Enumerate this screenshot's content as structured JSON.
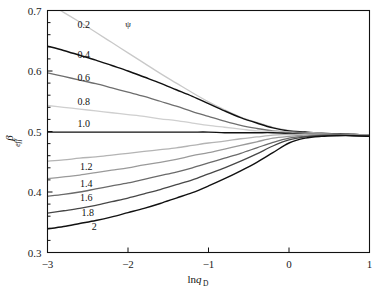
{
  "chart_data": {
    "type": "line",
    "title": "",
    "xlabel": "lnq_D",
    "xlabel_main": "ln",
    "xlabel_var": "q",
    "xlabel_sub": "D",
    "ylabel": "β_eff",
    "ylabel_main": "β",
    "ylabel_sub": "eff",
    "legend_symbol": "ψ",
    "legend_position": "inline-curve-labels",
    "grid": false,
    "xlim": [
      -3,
      1
    ],
    "ylim": [
      0.3,
      0.7
    ],
    "xticks": [
      -3,
      -2,
      -1,
      0,
      1
    ],
    "xtick_labels": [
      "−3",
      "−2",
      "−1",
      "0",
      "1"
    ],
    "yticks": [
      0.3,
      0.4,
      0.5,
      0.6,
      0.7
    ],
    "ytick_labels": [
      "0.3",
      "0.4",
      "0.5",
      "0.6",
      "0.7"
    ],
    "yminor_ticks": [
      0.32,
      0.34,
      0.36,
      0.38,
      0.42,
      0.44,
      0.46,
      0.48,
      0.52,
      0.54,
      0.56,
      0.58,
      0.62,
      0.64,
      0.66,
      0.68
    ],
    "x": [
      -3.0,
      -2.8,
      -2.6,
      -2.4,
      -2.2,
      -2.0,
      -1.8,
      -1.6,
      -1.4,
      -1.2,
      -1.0,
      -0.8,
      -0.6,
      -0.4,
      -0.2,
      0.0,
      0.2,
      0.4,
      0.6,
      0.8,
      1.0
    ],
    "series": [
      {
        "name": "0.2",
        "label": "0.2",
        "color": "#c9c9c9",
        "width": 1.3,
        "label_x": -2.55,
        "label_y": 0.676,
        "values": [
          0.712,
          0.697,
          0.681,
          0.664,
          0.647,
          0.63,
          0.613,
          0.596,
          0.58,
          0.564,
          0.549,
          0.536,
          0.524,
          0.515,
          0.507,
          0.502,
          0.499,
          0.497,
          0.496,
          0.495,
          0.494
        ]
      },
      {
        "name": "0.4",
        "label": "0.4",
        "color": "#111111",
        "width": 1.5,
        "label_x": -2.55,
        "label_y": 0.626,
        "values": [
          0.641,
          0.634,
          0.626,
          0.618,
          0.609,
          0.6,
          0.59,
          0.58,
          0.569,
          0.558,
          0.546,
          0.534,
          0.523,
          0.514,
          0.506,
          0.501,
          0.499,
          0.497,
          0.496,
          0.495,
          0.494
        ]
      },
      {
        "name": "0.6",
        "label": "0.6",
        "color": "#6e6e6e",
        "width": 1.3,
        "label_x": -2.55,
        "label_y": 0.589,
        "values": [
          0.597,
          0.591,
          0.585,
          0.579,
          0.572,
          0.565,
          0.558,
          0.55,
          0.542,
          0.533,
          0.525,
          0.517,
          0.51,
          0.505,
          0.501,
          0.499,
          0.498,
          0.497,
          0.496,
          0.495,
          0.494
        ]
      },
      {
        "name": "0.8",
        "label": "0.8",
        "color": "#cfcfcf",
        "width": 1.3,
        "label_x": -2.55,
        "label_y": 0.548,
        "values": [
          0.543,
          0.54,
          0.537,
          0.534,
          0.531,
          0.528,
          0.525,
          0.521,
          0.518,
          0.514,
          0.51,
          0.507,
          0.504,
          0.501,
          0.5,
          0.499,
          0.498,
          0.497,
          0.496,
          0.495,
          0.494
        ]
      },
      {
        "name": "1.0",
        "label": "1.0",
        "color": "#111111",
        "width": 1.4,
        "label_x": -2.55,
        "label_y": 0.512,
        "values": [
          0.499,
          0.499,
          0.499,
          0.499,
          0.499,
          0.499,
          0.499,
          0.499,
          0.499,
          0.499,
          0.499,
          0.498,
          0.498,
          0.498,
          0.498,
          0.497,
          0.497,
          0.496,
          0.496,
          0.495,
          0.494
        ]
      },
      {
        "name": "1.2",
        "label": "1.2",
        "color": "#b4b4b4",
        "width": 1.3,
        "label_x": -2.52,
        "label_y": 0.441,
        "values": [
          0.451,
          0.453,
          0.456,
          0.458,
          0.461,
          0.464,
          0.467,
          0.47,
          0.473,
          0.477,
          0.481,
          0.484,
          0.488,
          0.491,
          0.494,
          0.495,
          0.496,
          0.496,
          0.495,
          0.495,
          0.494
        ]
      },
      {
        "name": "1.4",
        "label": "1.4",
        "color": "#9a9a9a",
        "width": 1.3,
        "label_x": -2.52,
        "label_y": 0.414,
        "values": [
          0.422,
          0.425,
          0.428,
          0.432,
          0.436,
          0.44,
          0.445,
          0.449,
          0.454,
          0.46,
          0.465,
          0.471,
          0.477,
          0.483,
          0.489,
          0.492,
          0.494,
          0.495,
          0.495,
          0.494,
          0.494
        ]
      },
      {
        "name": "1.6",
        "label": "1.6",
        "color": "#6a6a6a",
        "width": 1.3,
        "label_x": -2.52,
        "label_y": 0.39,
        "values": [
          0.393,
          0.396,
          0.4,
          0.405,
          0.41,
          0.415,
          0.421,
          0.427,
          0.433,
          0.44,
          0.448,
          0.456,
          0.464,
          0.473,
          0.482,
          0.489,
          0.492,
          0.494,
          0.494,
          0.494,
          0.493
        ]
      },
      {
        "name": "1.8",
        "label": "1.8",
        "color": "#474747",
        "width": 1.3,
        "label_x": -2.5,
        "label_y": 0.366,
        "values": [
          0.365,
          0.369,
          0.373,
          0.378,
          0.384,
          0.39,
          0.397,
          0.404,
          0.412,
          0.42,
          0.43,
          0.44,
          0.451,
          0.463,
          0.476,
          0.486,
          0.491,
          0.493,
          0.494,
          0.493,
          0.493
        ]
      },
      {
        "name": "2",
        "label": "2",
        "color": "#111111",
        "width": 1.4,
        "label_x": -2.42,
        "label_y": 0.342,
        "values": [
          0.339,
          0.343,
          0.348,
          0.353,
          0.359,
          0.366,
          0.373,
          0.381,
          0.39,
          0.399,
          0.41,
          0.422,
          0.435,
          0.449,
          0.465,
          0.481,
          0.489,
          0.492,
          0.493,
          0.493,
          0.492
        ]
      }
    ],
    "legend_symbol_x": -2.0,
    "legend_symbol_y": 0.678
  }
}
